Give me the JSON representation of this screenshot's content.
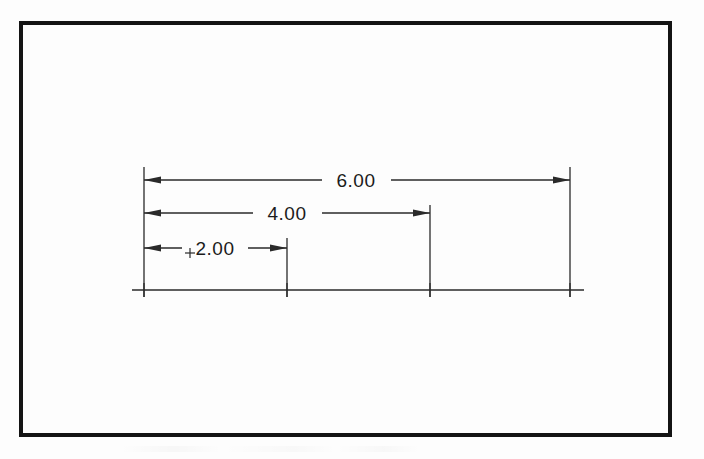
{
  "document": {
    "kind": "engineering-drawing",
    "title": "Baseline dimensioned part drawing",
    "background_color": "#fdfdfd",
    "ink_color": "#1b1b1b"
  },
  "border": {
    "name": "drawing-border",
    "x": 21,
    "y": 23,
    "width": 649,
    "height": 412,
    "stroke_width": 4,
    "color": "#141414"
  },
  "chart_data": {
    "type": "diagram",
    "subtype": "baseline-ordinate-dimensioning",
    "units": "inches",
    "datum": "left extension line",
    "baseline": {
      "label": "object-baseline",
      "y": 290,
      "x_start": 132,
      "x_end": 584,
      "tick_half_height": 7
    },
    "origin_x": 144,
    "scale_px_per_unit": 71,
    "stations": [
      {
        "label": "datum",
        "value": 0.0,
        "x": 144
      },
      {
        "label": "station-2",
        "value": 2.0,
        "x": 287
      },
      {
        "label": "station-4",
        "value": 4.0,
        "x": 430
      },
      {
        "label": "station-6",
        "value": 6.0,
        "x": 570
      }
    ],
    "extension_lines": [
      {
        "name": "extension-line-datum",
        "x": 144,
        "y_top": 167,
        "y_bottom": 297
      },
      {
        "name": "extension-line-2",
        "x": 287,
        "y_top": 238,
        "y_bottom": 297
      },
      {
        "name": "extension-line-4",
        "x": 430,
        "y_top": 205,
        "y_bottom": 297
      },
      {
        "name": "extension-line-6",
        "x": 570,
        "y_top": 167,
        "y_bottom": 297
      }
    ],
    "dimensions": [
      {
        "name": "dimension-2-00",
        "text": "2.00",
        "value": 2.0,
        "y": 248,
        "x_from": 144,
        "x_to": 287,
        "text_x": 215,
        "text_anchor": "middle",
        "gap_left": 182,
        "gap_right": 248,
        "has_center_mark": true,
        "center_mark_x": 190,
        "arrow_left": true,
        "arrow_right": true
      },
      {
        "name": "dimension-4-00",
        "text": "4.00",
        "value": 4.0,
        "y": 213,
        "x_from": 144,
        "x_to": 430,
        "text_x": 287,
        "text_anchor": "middle",
        "gap_left": 253,
        "gap_right": 322,
        "has_center_mark": false,
        "arrow_left": true,
        "arrow_right": true
      },
      {
        "name": "dimension-6-00",
        "text": "6.00",
        "value": 6.0,
        "y": 180,
        "x_from": 144,
        "x_to": 570,
        "text_x": 356,
        "text_anchor": "middle",
        "gap_left": 322,
        "gap_right": 391,
        "has_center_mark": false,
        "arrow_left": true,
        "arrow_right": true
      }
    ],
    "labels": [
      "2.00",
      "4.00",
      "6.00"
    ],
    "values": [
      2.0,
      4.0,
      6.0
    ]
  },
  "style": {
    "line_color": "#2a2a2a",
    "line_width": 1.3,
    "arrow_length": 17,
    "arrow_half_width": 3.6,
    "text_size_px": 19
  }
}
